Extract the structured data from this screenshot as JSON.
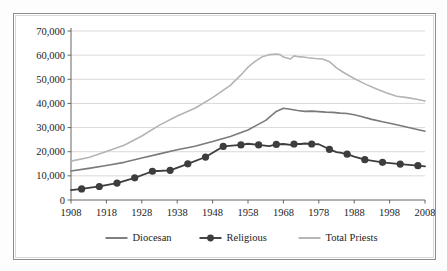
{
  "figure": {
    "caption": "",
    "background_color": "#ffffff",
    "border_color": "#8c8c8c"
  },
  "chart_data": {
    "type": "line",
    "title": "",
    "subtitle": "",
    "xlabel": "",
    "ylabel": "",
    "xlim": [
      1908,
      2008
    ],
    "ylim": [
      0,
      70000
    ],
    "grid": "horizontal",
    "legend_position": "bottom-center",
    "x_tick_labels": [
      "1908",
      "1918",
      "1928",
      "1938",
      "1948",
      "1958",
      "1968",
      "1978",
      "1988",
      "1998",
      "2008"
    ],
    "x_ticks": [
      1908,
      1918,
      1928,
      1938,
      1948,
      1958,
      1968,
      1978,
      1988,
      1998,
      2008
    ],
    "y_tick_labels": [
      "0",
      "10,000",
      "20,000",
      "30,000",
      "40,000",
      "50,000",
      "60,000",
      "70,000"
    ],
    "y_ticks": [
      0,
      10000,
      20000,
      30000,
      40000,
      50000,
      60000,
      70000
    ],
    "series": [
      {
        "name": "Diocesan",
        "color": "#7a7a7a",
        "line_width": 1.6,
        "markers": false,
        "x": [
          1908,
          1913,
          1918,
          1923,
          1928,
          1933,
          1938,
          1943,
          1948,
          1953,
          1958,
          1960,
          1963,
          1965,
          1966,
          1968,
          1970,
          1972,
          1974,
          1976,
          1978,
          1980,
          1982,
          1984,
          1986,
          1988,
          1990,
          1993,
          1996,
          2000,
          2004,
          2008
        ],
        "values": [
          12000,
          13100,
          14300,
          15600,
          17400,
          19100,
          20800,
          22300,
          24200,
          26300,
          29000,
          30600,
          33000,
          35500,
          36700,
          38000,
          37600,
          37100,
          36700,
          36800,
          36600,
          36400,
          36300,
          36000,
          35800,
          35300,
          34600,
          33400,
          32400,
          31200,
          29800,
          28500
        ]
      },
      {
        "name": "Religious",
        "color": "#3d3d3d",
        "line_width": 1.8,
        "markers": true,
        "marker_size": 3.6,
        "marker_x": [
          1911,
          1916,
          1921,
          1926,
          1931,
          1936,
          1941,
          1946,
          1951,
          1956,
          1961,
          1966,
          1971,
          1976,
          1981,
          1986,
          1991,
          1996,
          2001,
          2006
        ],
        "x": [
          1908,
          1911,
          1916,
          1921,
          1926,
          1931,
          1936,
          1941,
          1946,
          1951,
          1956,
          1958,
          1961,
          1964,
          1966,
          1968,
          1970,
          1971,
          1973,
          1974,
          1976,
          1978,
          1981,
          1983,
          1984,
          1986,
          1988,
          1991,
          1996,
          2001,
          2006,
          2008
        ],
        "values": [
          4100,
          4600,
          5600,
          7000,
          9200,
          11900,
          12300,
          15000,
          17800,
          22200,
          22800,
          23300,
          22800,
          22300,
          23000,
          23200,
          22800,
          23200,
          23200,
          23400,
          23200,
          23100,
          21000,
          19800,
          19600,
          19000,
          18000,
          16700,
          15600,
          14900,
          14200,
          13900
        ]
      },
      {
        "name": "Total Priests",
        "color": "#b4b4b4",
        "line_width": 1.6,
        "markers": false,
        "x": [
          1908,
          1913,
          1918,
          1923,
          1928,
          1933,
          1938,
          1943,
          1948,
          1953,
          1956,
          1958,
          1960,
          1962,
          1964,
          1966,
          1967,
          1968,
          1970,
          1971,
          1972,
          1973,
          1975,
          1977,
          1979,
          1980,
          1981,
          1983,
          1985,
          1988,
          1991,
          1994,
          1997,
          2000,
          2003,
          2006,
          2008
        ],
        "values": [
          16100,
          17600,
          20100,
          22700,
          26500,
          31000,
          34800,
          38000,
          42400,
          47500,
          51800,
          55000,
          57400,
          59300,
          60200,
          60500,
          60300,
          59200,
          58400,
          59700,
          59400,
          59300,
          58900,
          58600,
          58400,
          57900,
          57300,
          54700,
          52800,
          50300,
          48100,
          46200,
          44400,
          43000,
          42400,
          41600,
          41000
        ]
      }
    ]
  },
  "legend": {
    "items": [
      {
        "label": "Diocesan",
        "color": "#7a7a7a",
        "marker": false
      },
      {
        "label": "Religious",
        "color": "#3d3d3d",
        "marker": true
      },
      {
        "label": "Total Priests",
        "color": "#b4b4b4",
        "marker": false
      }
    ]
  }
}
